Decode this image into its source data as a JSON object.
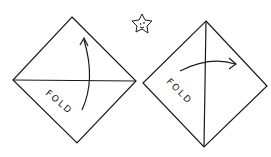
{
  "diagram": {
    "steps": [
      {
        "id": 1,
        "label": "FOLD",
        "fold_line": "horizontal",
        "arrow": "bottom-to-top"
      },
      {
        "id": 2,
        "label": "FOLD",
        "fold_line": "vertical",
        "arrow": "left-to-right"
      }
    ],
    "decoration": "star-face",
    "colors": {
      "ink": "#1a1a1a",
      "background": "#ffffff"
    }
  }
}
